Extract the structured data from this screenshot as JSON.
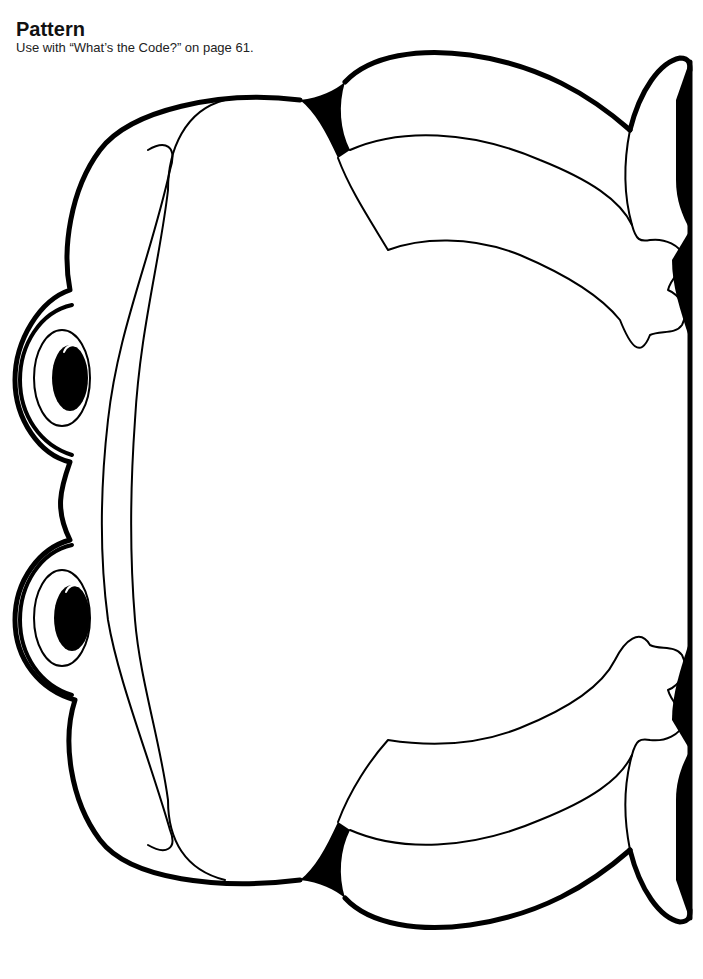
{
  "header": {
    "title": "Pattern",
    "subtitle": "Use with “What’s the Code?” on page 61."
  },
  "illustration": {
    "subject": "frog-outline",
    "orientation": "rotated-90-facing-left",
    "stroke_color": "#000000",
    "fill_color": "#ffffff"
  }
}
